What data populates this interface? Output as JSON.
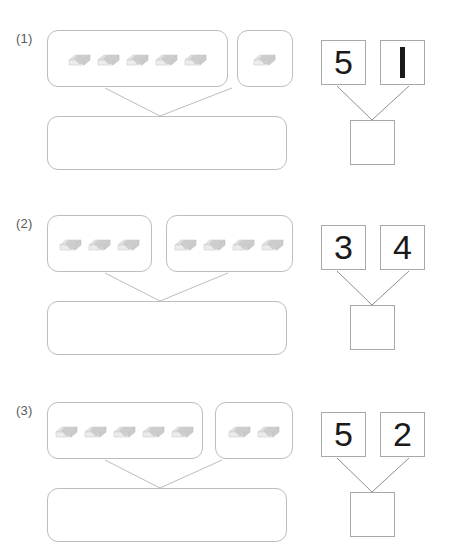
{
  "page": {
    "background_color": "#ffffff",
    "box_border_color": "#bdbdbd",
    "numeral_color": "#1a1a1a",
    "eraser_body_color": "#c9c9c9",
    "eraser_top_color": "#dcdcdc",
    "eraser_sleeve_color": "#f2f2f2"
  },
  "problems": [
    {
      "label": "(1)",
      "groups": [
        {
          "name": "left-group",
          "count": 5
        },
        {
          "name": "right-group",
          "count": 1
        }
      ],
      "answer_strip_value": "",
      "bond": {
        "left_number": "5",
        "right_number": "1",
        "sum_value": ""
      }
    },
    {
      "label": "(2)",
      "groups": [
        {
          "name": "left-group",
          "count": 3
        },
        {
          "name": "right-group",
          "count": 4
        }
      ],
      "answer_strip_value": "",
      "bond": {
        "left_number": "3",
        "right_number": "4",
        "sum_value": ""
      }
    },
    {
      "label": "(3)",
      "groups": [
        {
          "name": "left-group",
          "count": 5
        },
        {
          "name": "right-group",
          "count": 2
        }
      ],
      "answer_strip_value": "",
      "bond": {
        "left_number": "5",
        "right_number": "2",
        "sum_value": ""
      }
    }
  ]
}
